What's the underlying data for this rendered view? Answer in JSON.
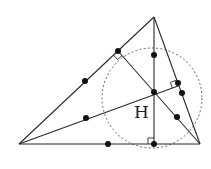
{
  "diagram": {
    "type": "nine-point-circle",
    "labels": {
      "orthocenter": "H"
    },
    "vertices": {
      "A": [
        19,
        144
      ],
      "B": [
        200,
        144
      ],
      "C": [
        154,
        17
      ]
    },
    "orthocenter": [
      154,
      92
    ],
    "feet": {
      "from_C_on_AB": [
        154,
        144
      ],
      "from_B_on_AC": [
        118,
        51
      ],
      "from_A_on_BC": [
        178,
        86
      ]
    },
    "circle": {
      "cx": 152,
      "cy": 98,
      "r": 50
    },
    "points": [
      [
        118,
        51
      ],
      [
        154,
        55
      ],
      [
        85,
        81
      ],
      [
        178,
        83
      ],
      [
        182,
        93
      ],
      [
        154,
        92
      ],
      [
        86,
        118
      ],
      [
        177,
        117
      ],
      [
        108,
        144
      ],
      [
        154,
        144
      ]
    ],
    "colors": {
      "stroke": "#2a2a2a",
      "dot": "#111111",
      "circle": "#555555"
    }
  }
}
